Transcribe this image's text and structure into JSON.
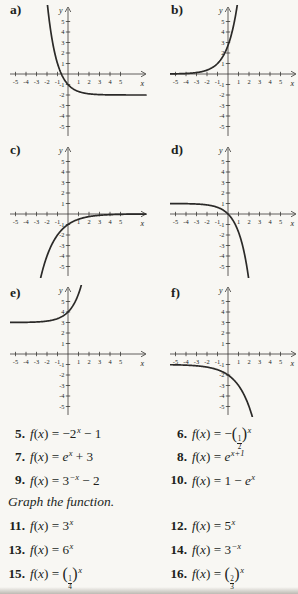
{
  "page": {
    "background": "#f8f7f3",
    "ink": "#211f1c",
    "curve_color": "#2b2a28",
    "axis_color": "#3a3835"
  },
  "axes": {
    "x_label": "x",
    "y_label": "y",
    "x_tick_labels": [
      "-5",
      "-4",
      "-3",
      "-2",
      "-1",
      "1",
      "2",
      "3",
      "4",
      "5"
    ],
    "y_tick_labels": [
      "5",
      "4",
      "3",
      "2",
      "1",
      "-1",
      "-2",
      "-3",
      "-4",
      "-5"
    ]
  },
  "chart_data": [
    {
      "panel": "a)",
      "type": "line",
      "expression": "y = 3^(-x) - 2",
      "params": {
        "a": 1,
        "b": 3,
        "c": -1,
        "d": 0,
        "k": -2
      },
      "horizontal_asymptote": -2,
      "y_intercept": -1,
      "x_ticks": [
        -5,
        -4,
        -3,
        -2,
        -1,
        1,
        2,
        3,
        4,
        5
      ],
      "y_ticks": [
        -5,
        -4,
        -3,
        -2,
        -1,
        1,
        2,
        3,
        4,
        5
      ],
      "xlim": [
        -5.5,
        7.4
      ],
      "ylim": [
        -6.3,
        6.3
      ]
    },
    {
      "panel": "b)",
      "type": "line",
      "expression": "y = e^(x+1)",
      "params": {
        "a": 1,
        "b": 2.718281828,
        "c": 1,
        "d": 1,
        "k": 0
      },
      "horizontal_asymptote": 0,
      "y_intercept": 2.72,
      "x_ticks": [
        -5,
        -4,
        -3,
        -2,
        -1,
        1,
        2,
        3,
        4,
        5
      ],
      "y_ticks": [
        -5,
        -4,
        -3,
        -2,
        -1,
        1,
        2,
        3,
        4,
        5
      ],
      "xlim": [
        -5.5,
        6.5
      ],
      "ylim": [
        -6.3,
        6.3
      ]
    },
    {
      "panel": "c)",
      "type": "line",
      "expression": "y = -(1/2)^x",
      "params": {
        "a": -1,
        "b": 0.5,
        "c": 1,
        "d": 0,
        "k": 0
      },
      "horizontal_asymptote": 0,
      "y_intercept": -1,
      "x_ticks": [
        -5,
        -4,
        -3,
        -2,
        -1,
        1,
        2,
        3,
        4,
        5
      ],
      "y_ticks": [
        -5,
        -4,
        -3,
        -2,
        -1,
        1,
        2,
        3,
        4,
        5
      ],
      "xlim": [
        -5.5,
        7.4
      ],
      "ylim": [
        -6.3,
        6.3
      ]
    },
    {
      "panel": "d)",
      "type": "line",
      "expression": "y = 1 - e^x",
      "params": {
        "a": -1,
        "b": 2.718281828,
        "c": 1,
        "d": 0,
        "k": 1
      },
      "horizontal_asymptote": 1,
      "y_intercept": 0,
      "x_ticks": [
        -5,
        -4,
        -3,
        -2,
        -1,
        1,
        2,
        3,
        4,
        5
      ],
      "y_ticks": [
        -5,
        -4,
        -3,
        -2,
        -1,
        1,
        2,
        3,
        4,
        5
      ],
      "xlim": [
        -5.5,
        6.5
      ],
      "ylim": [
        -6.3,
        6.3
      ]
    },
    {
      "panel": "e)",
      "type": "line",
      "expression": "y = e^x + 3",
      "params": {
        "a": 1,
        "b": 2.718281828,
        "c": 1,
        "d": 0,
        "k": 3
      },
      "horizontal_asymptote": 3,
      "y_intercept": 4,
      "x_ticks": [
        -5,
        -4,
        -3,
        -2,
        -1,
        1,
        2,
        3,
        4,
        5
      ],
      "y_ticks": [
        -5,
        -4,
        -3,
        -2,
        -1,
        1,
        2,
        3,
        4,
        5
      ],
      "xlim": [
        -5.5,
        7.4
      ],
      "ylim": [
        -6.3,
        6.3
      ]
    },
    {
      "panel": "f)",
      "type": "line",
      "expression": "y = -2^x - 1",
      "params": {
        "a": -1,
        "b": 2,
        "c": 1,
        "d": 0,
        "k": -1
      },
      "horizontal_asymptote": -1,
      "y_intercept": -2,
      "x_ticks": [
        -5,
        -4,
        -3,
        -2,
        -1,
        1,
        2,
        3,
        4,
        5
      ],
      "y_ticks": [
        -5,
        -4,
        -3,
        -2,
        -1,
        1,
        2,
        3,
        4,
        5
      ],
      "xlim": [
        -5.5,
        6.5
      ],
      "ylim": [
        -6.3,
        6.3
      ]
    }
  ],
  "exercises": {
    "func_prefix": [
      {
        "i": "f"
      },
      {
        "p": "("
      },
      {
        "i": "x"
      },
      {
        "p": ") = "
      }
    ],
    "heading": "Graph the function.",
    "matching": [
      {
        "num": "5.",
        "rhs": [
          {
            "p": "−2"
          },
          {
            "s": "x"
          },
          {
            "p": " − 1"
          }
        ]
      },
      {
        "num": "6.",
        "rhs": [
          {
            "p": "−"
          },
          {
            "bp": "("
          },
          {
            "fr": [
              "1",
              "2"
            ]
          },
          {
            "bp": ")"
          },
          {
            "s": "x"
          }
        ]
      },
      {
        "num": "7.",
        "rhs": [
          {
            "i": "e"
          },
          {
            "s": "x"
          },
          {
            "p": " + 3"
          }
        ]
      },
      {
        "num": "8.",
        "rhs": [
          {
            "i": "e"
          },
          {
            "s": "x+1"
          }
        ]
      },
      {
        "num": "9.",
        "rhs": [
          {
            "p": "3"
          },
          {
            "s": "−x"
          },
          {
            "p": " − 2"
          }
        ]
      },
      {
        "num": "10.",
        "rhs": [
          {
            "p": "1 − "
          },
          {
            "i": "e"
          },
          {
            "s": "x"
          }
        ]
      }
    ],
    "graphing": [
      {
        "num": "11.",
        "rhs": [
          {
            "p": "3"
          },
          {
            "s": "x"
          }
        ]
      },
      {
        "num": "12.",
        "rhs": [
          {
            "p": "5"
          },
          {
            "s": "x"
          }
        ]
      },
      {
        "num": "13.",
        "rhs": [
          {
            "p": "6"
          },
          {
            "s": "x"
          }
        ]
      },
      {
        "num": "14.",
        "rhs": [
          {
            "p": "3"
          },
          {
            "s": "−x"
          }
        ]
      },
      {
        "num": "15.",
        "rhs": [
          {
            "bp": "("
          },
          {
            "fr": [
              "1",
              "4"
            ]
          },
          {
            "bp": ")"
          },
          {
            "s": "x"
          }
        ]
      },
      {
        "num": "16.",
        "rhs": [
          {
            "bp": "("
          },
          {
            "fr": [
              "2",
              "3"
            ]
          },
          {
            "bp": ")"
          },
          {
            "s": "x"
          }
        ]
      }
    ]
  }
}
